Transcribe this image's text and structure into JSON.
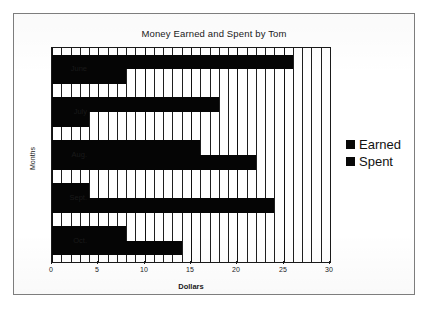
{
  "chart_data": {
    "type": "bar",
    "orientation": "horizontal",
    "title": "Money Earned and Spent by Tom",
    "xlabel": "Dollars",
    "ylabel": "Months",
    "categories": [
      "June",
      "July",
      "Aug.",
      "Sept.",
      "Oct."
    ],
    "series": [
      {
        "name": "Earned",
        "color": "#050505",
        "values": [
          26,
          18,
          16,
          4,
          8
        ]
      },
      {
        "name": "Spent",
        "color": "#050505",
        "values": [
          8,
          4,
          22,
          24,
          14
        ]
      }
    ],
    "xlim": [
      0,
      30
    ],
    "xticks": [
      0,
      5,
      10,
      15,
      20,
      25,
      30
    ],
    "xtick_labels": [
      "0",
      "5",
      "10",
      "15",
      "20",
      "25",
      "30"
    ],
    "gridline_interval": 1,
    "grid": true,
    "legend_position": "right-outside",
    "legend_entries": [
      "Earned",
      "Spent"
    ]
  },
  "legend": {
    "items": [
      {
        "label": "Earned"
      },
      {
        "label": "Spent"
      }
    ]
  }
}
